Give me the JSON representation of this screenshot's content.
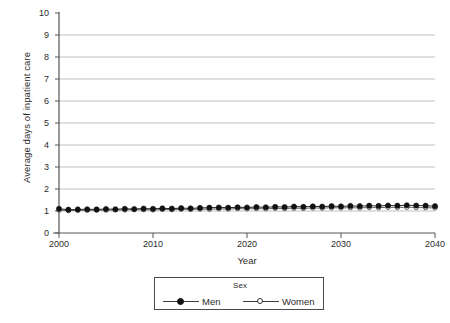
{
  "chart_data": {
    "type": "line",
    "title": "",
    "xlabel": "Year",
    "ylabel": "Average days of inpatient care",
    "xlim": [
      2000,
      2040
    ],
    "ylim": [
      0,
      10
    ],
    "grid": true,
    "grid_axis": "y",
    "legend_position": "bottom",
    "legend_title": "Sex",
    "xticks": [
      2000,
      2010,
      2020,
      2030,
      2040
    ],
    "yticks": [
      0,
      1,
      2,
      3,
      4,
      5,
      6,
      7,
      8,
      9,
      10
    ],
    "x": [
      2000,
      2001,
      2002,
      2003,
      2004,
      2005,
      2006,
      2007,
      2008,
      2009,
      2010,
      2011,
      2012,
      2013,
      2014,
      2015,
      2016,
      2017,
      2018,
      2019,
      2020,
      2021,
      2022,
      2023,
      2024,
      2025,
      2026,
      2027,
      2028,
      2029,
      2030,
      2031,
      2032,
      2033,
      2034,
      2035,
      2036,
      2037,
      2038,
      2039,
      2040
    ],
    "series": [
      {
        "name": "Men",
        "marker": "filled-circle",
        "color": "#111111",
        "values": [
          1.1,
          1.06,
          1.07,
          1.08,
          1.07,
          1.09,
          1.08,
          1.1,
          1.09,
          1.11,
          1.1,
          1.12,
          1.11,
          1.13,
          1.12,
          1.14,
          1.15,
          1.16,
          1.15,
          1.17,
          1.16,
          1.18,
          1.17,
          1.19,
          1.18,
          1.2,
          1.19,
          1.21,
          1.2,
          1.22,
          1.21,
          1.23,
          1.22,
          1.24,
          1.23,
          1.25,
          1.24,
          1.26,
          1.25,
          1.24,
          1.22
        ]
      },
      {
        "name": "Women",
        "marker": "open-circle",
        "color": "#555555",
        "values": [
          1.04,
          1.02,
          1.03,
          1.03,
          1.04,
          1.04,
          1.05,
          1.05,
          1.06,
          1.06,
          1.05,
          1.07,
          1.06,
          1.08,
          1.07,
          1.09,
          1.08,
          1.1,
          1.09,
          1.11,
          1.1,
          1.11,
          1.1,
          1.12,
          1.11,
          1.13,
          1.12,
          1.14,
          1.13,
          1.15,
          1.14,
          1.15,
          1.14,
          1.16,
          1.15,
          1.17,
          1.16,
          1.17,
          1.16,
          1.15,
          1.14
        ]
      }
    ]
  },
  "legend": {
    "title": "Sex",
    "entries": [
      {
        "label": "Men"
      },
      {
        "label": "Women"
      }
    ]
  },
  "colors": {
    "grid": "#b0b0b0",
    "axis": "#555555",
    "men": "#111111",
    "women": "#555555",
    "background": "#ffffff"
  }
}
